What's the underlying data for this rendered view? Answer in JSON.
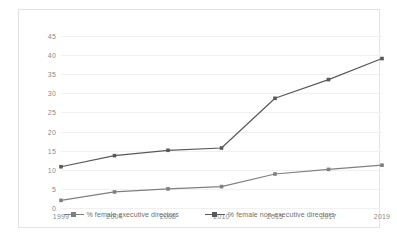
{
  "chart_data": {
    "type": "line",
    "title": "",
    "xlabel": "",
    "ylabel": "",
    "categories": [
      "1999",
      "2004",
      "2008",
      "2010",
      "2015",
      "2017",
      "2019"
    ],
    "ylim": [
      0,
      45
    ],
    "ytick_step": 5,
    "yticks": [
      "0",
      "5",
      "10",
      "15",
      "20",
      "25",
      "30",
      "35",
      "40",
      "45"
    ],
    "grid": "horizontal",
    "legend_position": "bottom-center",
    "series": [
      {
        "name": "% female executive directors",
        "color": "#7f7f7f",
        "marker": "square",
        "values": [
          2.0,
          4.2,
          5.0,
          5.6,
          8.9,
          10.1,
          11.2
        ]
      },
      {
        "name": "% female non-executive directors",
        "color": "#595959",
        "marker": "square",
        "values": [
          10.8,
          13.7,
          15.1,
          15.7,
          28.7,
          33.6,
          39.1
        ]
      }
    ]
  },
  "colors": {
    "gridline": "#f0f0f0",
    "axis_text": "#8a8a8a",
    "legend_text": "#6f6f6f",
    "frame_border": "#e3e3e3",
    "background": "#ffffff"
  }
}
